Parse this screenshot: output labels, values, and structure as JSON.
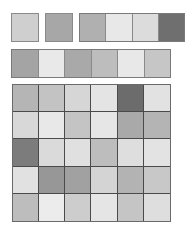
{
  "row_a": {
    "singles": [
      {
        "color": "#cfcfcf",
        "x": 11,
        "y": 13,
        "w": 28,
        "h": 29
      },
      {
        "color": "#a7a7a7",
        "x": 45,
        "y": 13,
        "w": 28,
        "h": 29
      }
    ],
    "strip": {
      "x": 79,
      "y": 13,
      "w": 106,
      "h": 29,
      "cells": [
        "#b0b0b0",
        "#e8e8e8",
        "#dcdcdc",
        "#6f6f6f"
      ]
    }
  },
  "row_b": {
    "strip": {
      "x": 11,
      "y": 49,
      "w": 160,
      "h": 29,
      "cells": [
        "#a4a4a4",
        "#e9e9e9",
        "#a9a9a9",
        "#bdbdbd",
        "#e8e8e8",
        "#c6c6c6"
      ]
    }
  },
  "grid": {
    "x": 12,
    "y": 84,
    "w": 159,
    "h": 138,
    "cols": 6,
    "rows": [
      [
        "#b5b5b5",
        "#c3c3c3",
        "#d6d6d6",
        "#e4e4e4",
        "#6c6c6c",
        "#e2e2e2"
      ],
      [
        "#d8d8d8",
        "#e8e8e8",
        "#c4c4c4",
        "#e6e6e6",
        "#a9a9a9",
        "#b4b4b4"
      ],
      [
        "#7c7c7c",
        "#dadada",
        "#e0e0e0",
        "#bdbdbd",
        "#dedede",
        "#e3e3e3"
      ],
      [
        "#e1e1e1",
        "#979797",
        "#a1a1a1",
        "#d4d4d4",
        "#b3b3b3",
        "#c8c8c8"
      ],
      [
        "#bdbdbd",
        "#ececec",
        "#cdcdcd",
        "#e5e5e5",
        "#c5c5c5",
        "#dedede"
      ]
    ]
  }
}
